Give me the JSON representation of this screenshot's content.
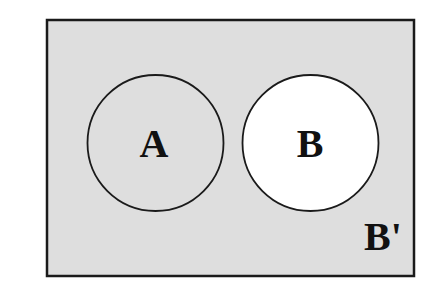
{
  "diagram": {
    "type": "venn",
    "universe": {
      "shaded": true,
      "fill": "#dedede",
      "stroke": "#1a1a1a"
    },
    "sets": [
      {
        "label": "A",
        "shaded": true,
        "fill": "#dedede"
      },
      {
        "label": "B",
        "shaded": false,
        "fill": "#ffffff"
      }
    ],
    "region_label": "B'",
    "relationship": "disjoint"
  }
}
